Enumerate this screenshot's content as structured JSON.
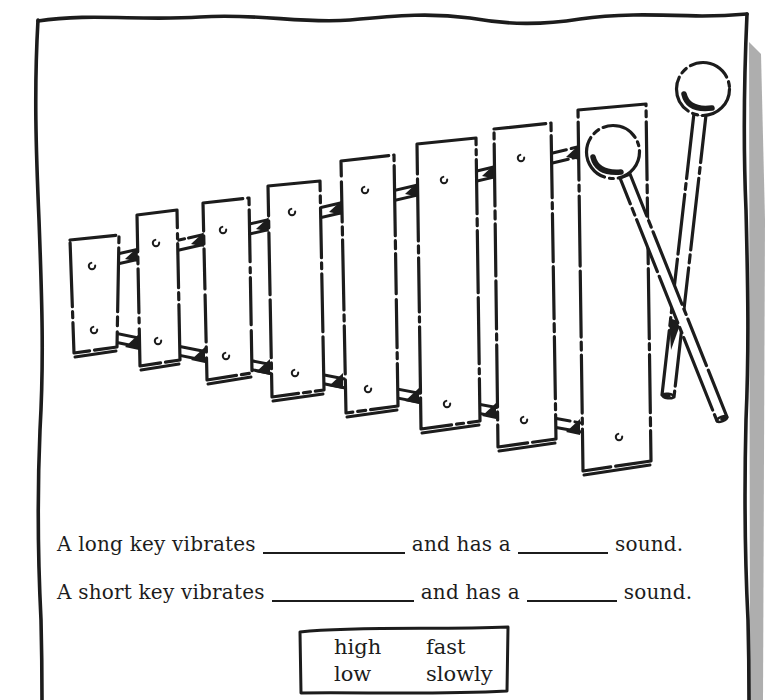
{
  "colors": {
    "ink": "#1c1c1c",
    "paper": "#ffffff",
    "shadow": "#a0a0a0"
  },
  "illustration": {
    "subject": "hand-drawn xylophone with eight keys and two mallets",
    "keys": 8,
    "mallets": 2
  },
  "questions": [
    {
      "prefix": "A long key vibrates",
      "conj": "and has a",
      "suffix": "sound."
    },
    {
      "prefix": "A short key vibrates",
      "conj": "and has a",
      "suffix": "sound."
    }
  ],
  "word_bank": {
    "items": [
      "high",
      "fast",
      "low",
      "slowly"
    ]
  }
}
